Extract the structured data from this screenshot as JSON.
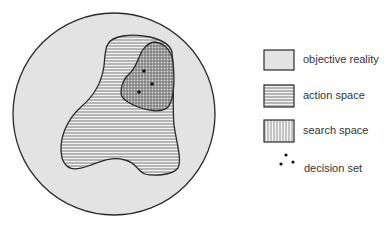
{
  "diagram": {
    "regions": [
      {
        "id": "objective_reality",
        "label": "objective reality",
        "pattern": "solid-gray",
        "fill": "#e3e3e3"
      },
      {
        "id": "action_space",
        "label": "action space",
        "pattern": "horizontal-lines"
      },
      {
        "id": "search_space",
        "label": "search space",
        "pattern": "vertical-lines"
      },
      {
        "id": "decision_set",
        "label": "decision set",
        "pattern": "dots",
        "points": [
          [
            144,
            71
          ],
          [
            152,
            84
          ],
          [
            139,
            92
          ]
        ]
      }
    ],
    "colors": {
      "stroke": "#2a2a2a",
      "fill_gray": "#e3e3e3",
      "hatch": "#6a6a6a",
      "text": "#333333"
    }
  },
  "legend": {
    "items": [
      {
        "label": "objective reality",
        "icon": "gray-square-icon"
      },
      {
        "label": "action space",
        "icon": "horizontal-hatch-square-icon"
      },
      {
        "label": "search space",
        "icon": "vertical-hatch-square-icon"
      },
      {
        "label": "decision set",
        "icon": "three-dots-icon"
      }
    ]
  }
}
